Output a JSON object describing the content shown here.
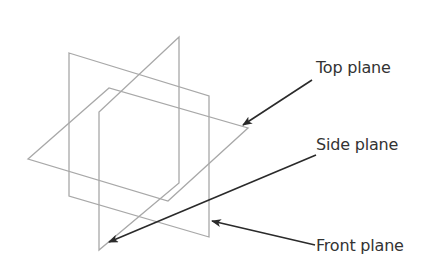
{
  "diagram": {
    "type": "orthographic-projection-planes",
    "colors": {
      "plane_stroke": "#a8a8a8",
      "arrow": "#2a2a2a",
      "text": "#333333",
      "background": "#ffffff"
    },
    "planes": [
      {
        "name": "front-plane",
        "points": "69,53 209,96 209,237 69,196"
      },
      {
        "name": "side-plane",
        "points": "179,37 179,183 99,250 99,112"
      },
      {
        "name": "top-plane",
        "points": "28,159 109,88 248,128 168,201"
      }
    ],
    "labels": [
      {
        "id": "top",
        "text": "Top plane",
        "x": 316,
        "y": 60
      },
      {
        "id": "side",
        "text": "Side plane",
        "x": 316,
        "y": 137
      },
      {
        "id": "front",
        "text": "Front plane",
        "x": 316,
        "y": 238
      }
    ],
    "arrows": [
      {
        "label": "Top plane",
        "x1": 312,
        "y1": 80,
        "x2": 243,
        "y2": 125
      },
      {
        "label": "Side plane",
        "x1": 316,
        "y1": 155,
        "x2": 109,
        "y2": 242
      },
      {
        "label": "Front plane",
        "x1": 315,
        "y1": 245,
        "x2": 212,
        "y2": 221
      }
    ]
  }
}
